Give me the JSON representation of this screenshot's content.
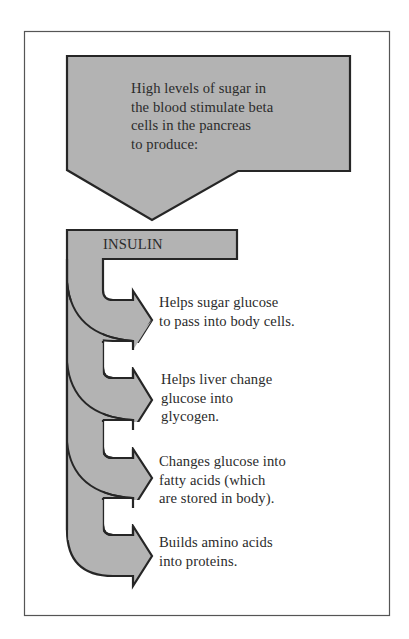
{
  "diagram": {
    "type": "flowchart",
    "frame": {
      "border_color": "#555555",
      "background": "#ffffff"
    },
    "colors": {
      "fill": "#b3b3b3",
      "stroke": "#262626",
      "text": "#2b2b2b"
    },
    "source_box": {
      "lines": [
        "High levels of sugar in",
        "the blood stimulate beta",
        "cells in the pancreas",
        "to produce:"
      ]
    },
    "hormone": {
      "label": "INSULIN"
    },
    "effects": [
      {
        "lines": [
          "Helps sugar glucose",
          "to pass into body cells."
        ]
      },
      {
        "lines": [
          "Helps liver change",
          "glucose into",
          "glycogen."
        ]
      },
      {
        "lines": [
          "Changes glucose into",
          "fatty acids (which",
          "are stored in body)."
        ]
      },
      {
        "lines": [
          "Builds amino acids",
          "into proteins."
        ]
      }
    ]
  }
}
